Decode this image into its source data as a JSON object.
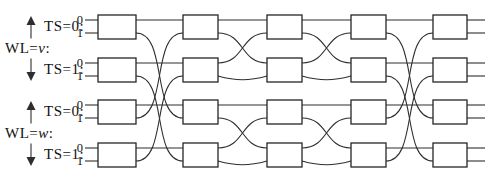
{
  "figure": {
    "type": "butterfly-network-diagram",
    "columns": 5,
    "stage_patterns": [
      "stride2",
      "stride1",
      "stride1",
      "stride2"
    ],
    "colors": {
      "background": "#ffffff",
      "line": "#2e2e2e",
      "box_fill": "#ffffff",
      "box_border": "#262626",
      "text": "#111111"
    },
    "groups": [
      {
        "wl_prefix": "WL=",
        "wl_var": "v",
        "wl_colon": ":",
        "rows": [
          {
            "ts_label": "TS=0:",
            "ports": [
              "0",
              "1"
            ]
          },
          {
            "ts_label": "TS=1:",
            "ports": [
              "0",
              "1"
            ]
          }
        ]
      },
      {
        "wl_prefix": "WL=",
        "wl_var": "w",
        "wl_colon": ":",
        "rows": [
          {
            "ts_label": "TS=0:",
            "ports": [
              "0",
              "1"
            ]
          },
          {
            "ts_label": "TS=1:",
            "ports": [
              "0",
              "1"
            ]
          }
        ]
      }
    ]
  }
}
